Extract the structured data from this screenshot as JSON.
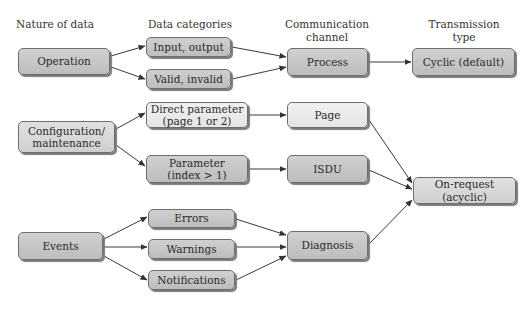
{
  "headers": {
    "nature": "Nature of data",
    "categories": "Data categories",
    "channel_line1": "Communication",
    "channel_line2": "channel",
    "transmission_line1": "Transmission",
    "transmission_line2": "type"
  },
  "nodes": {
    "operation": "Operation",
    "configuration_line1": "Configuration/",
    "configuration_line2": "maintenance",
    "events": "Events",
    "input_output": "Input, output",
    "valid_invalid": "Valid, invalid",
    "direct_parameter_line1": "Direct parameter",
    "direct_parameter_line2": "(page 1 or 2)",
    "parameter_line1": "Parameter",
    "parameter_line2": "(index > 1)",
    "errors": "Errors",
    "warnings": "Warnings",
    "notifications": "Notifications",
    "process": "Process",
    "page": "Page",
    "isdu": "ISDU",
    "diagnosis": "Diagnosis",
    "cyclic": "Cyclic (default)",
    "on_request": "On-request (acyclic)"
  },
  "edges": [
    [
      "operation",
      "input_output"
    ],
    [
      "operation",
      "valid_invalid"
    ],
    [
      "input_output",
      "process"
    ],
    [
      "valid_invalid",
      "process"
    ],
    [
      "process",
      "cyclic"
    ],
    [
      "configuration",
      "direct_parameter"
    ],
    [
      "configuration",
      "parameter"
    ],
    [
      "direct_parameter",
      "page"
    ],
    [
      "parameter",
      "isdu"
    ],
    [
      "page",
      "on_request"
    ],
    [
      "isdu",
      "on_request"
    ],
    [
      "diagnosis",
      "on_request"
    ],
    [
      "events",
      "errors"
    ],
    [
      "events",
      "warnings"
    ],
    [
      "events",
      "notifications"
    ],
    [
      "errors",
      "diagnosis"
    ],
    [
      "warnings",
      "diagnosis"
    ],
    [
      "notifications",
      "diagnosis"
    ]
  ]
}
